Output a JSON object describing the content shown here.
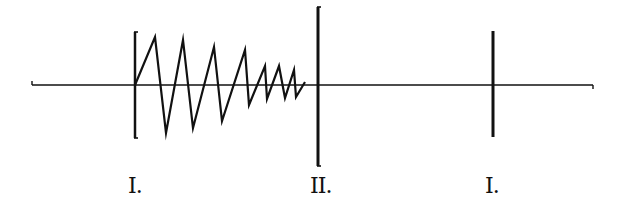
{
  "diagram": {
    "stroke_color": "#111111",
    "background": "#ffffff",
    "axis": {
      "x1": 32,
      "x2": 593,
      "y": 85,
      "end_tick": 4
    },
    "markers": [
      {
        "id": "marker-1-left",
        "x": 135,
        "y1": 32,
        "y2": 138,
        "width": 2.5,
        "serif": true,
        "label": "I.",
        "label_x": 128,
        "label_y": 175
      },
      {
        "id": "marker-2-center",
        "x": 318,
        "y1": 7,
        "y2": 166,
        "width": 3,
        "serif": true,
        "label": "II.",
        "label_x": 310,
        "label_y": 175
      },
      {
        "id": "marker-1-right",
        "x": 493,
        "y1": 31,
        "y2": 137,
        "width": 3,
        "serif": false,
        "label": "I.",
        "label_x": 485,
        "label_y": 175
      }
    ],
    "zigzag": {
      "points": [
        [
          135,
          85
        ],
        [
          155,
          37
        ],
        [
          166,
          133
        ],
        [
          183,
          40
        ],
        [
          193,
          128
        ],
        [
          214,
          47
        ],
        [
          222,
          121
        ],
        [
          245,
          50
        ],
        [
          249,
          105
        ],
        [
          265,
          66
        ],
        [
          267,
          99
        ],
        [
          279,
          66
        ],
        [
          285,
          98
        ],
        [
          294,
          70
        ],
        [
          296,
          97
        ],
        [
          305,
          82
        ]
      ],
      "stroke_width": 2.2
    }
  }
}
